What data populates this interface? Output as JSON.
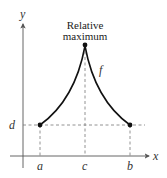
{
  "diagram": {
    "annotation": {
      "line1": "Relative",
      "line2": "maximum"
    },
    "function_label": "f",
    "axes": {
      "x_label": "x",
      "y_label": "y"
    },
    "x_ticks": {
      "a": "a",
      "c": "c",
      "b": "b"
    },
    "y_ticks": {
      "d": "d"
    },
    "colors": {
      "curve": "#111111",
      "axes": "#555555",
      "dashed": "#777777"
    }
  }
}
